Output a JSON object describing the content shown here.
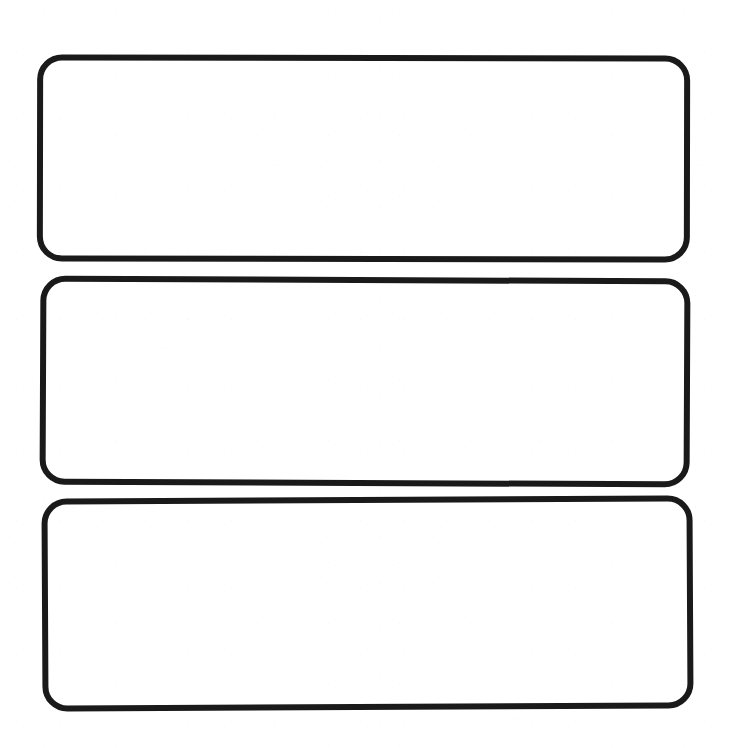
{
  "page": {
    "background_color": "#ffffff",
    "width": 730,
    "height": 748,
    "media": "scanned-paper"
  },
  "style": {
    "stroke_color": "#1a1a1a",
    "stroke_width_px": 6,
    "corner_radius_px": 25,
    "fill_color": "#ffffff"
  },
  "boxes": [
    {
      "name": "answer-box-1",
      "index": "1",
      "value": "",
      "placeholder": "",
      "x": 37,
      "y": 55,
      "width": 653,
      "height": 207,
      "rotation_deg": 0.1,
      "stroke_width_px": 6,
      "corner_radius_px": 25,
      "state": "empty"
    },
    {
      "name": "answer-box-2",
      "index": "2",
      "value": "",
      "placeholder": "",
      "x": 40,
      "y": 277,
      "width": 650,
      "height": 209,
      "rotation_deg": 0.25,
      "stroke_width_px": 6,
      "corner_radius_px": 25,
      "state": "empty"
    },
    {
      "name": "answer-box-3",
      "index": "3",
      "value": "",
      "placeholder": "",
      "x": 42,
      "y": 497,
      "width": 651,
      "height": 213,
      "rotation_deg": -0.3,
      "stroke_width_px": 6,
      "corner_radius_px": 25,
      "state": "empty"
    }
  ]
}
